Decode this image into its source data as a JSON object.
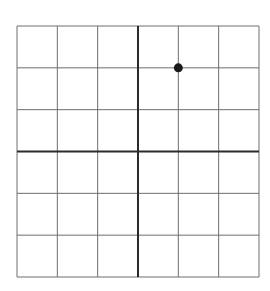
{
  "chart_data": {
    "type": "scatter",
    "title": "",
    "xlabel": "",
    "ylabel": "",
    "xlim": [
      -3,
      3
    ],
    "ylim": [
      -3,
      3
    ],
    "grid": true,
    "grid_step": 1,
    "axes_at_origin": true,
    "legend": null,
    "series": [
      {
        "name": "point",
        "x": [
          1
        ],
        "y": [
          2
        ],
        "color": "#1a1a1a"
      }
    ]
  },
  "style": {
    "grid_color": "#6e6e6e",
    "axis_color": "#2a2a2a",
    "point_color": "#1a1a1a"
  }
}
